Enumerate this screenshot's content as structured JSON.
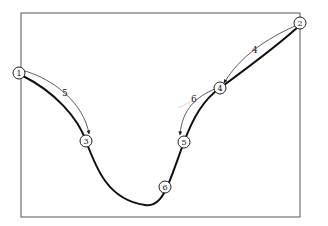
{
  "diagram": {
    "frame": {
      "x": 21,
      "y": 13,
      "w": 279,
      "h": 204,
      "stroke": "#555555"
    },
    "nodes": [
      {
        "id": "1",
        "label": "1",
        "x": 19,
        "y": 73
      },
      {
        "id": "2",
        "label": "2",
        "x": 300,
        "y": 23
      },
      {
        "id": "3",
        "label": "3",
        "x": 86,
        "y": 141
      },
      {
        "id": "4",
        "label": "4",
        "x": 220,
        "y": 88
      },
      {
        "id": "5",
        "label": "5",
        "x": 184,
        "y": 142
      },
      {
        "id": "6",
        "label": "6",
        "x": 165,
        "y": 187
      }
    ],
    "arrows": [
      {
        "from": "1",
        "to": "3",
        "label": "5",
        "label_x": 64,
        "label_y": 93
      },
      {
        "from": "2",
        "to": "4",
        "label": "4",
        "label_x": 254,
        "label_y": 51
      },
      {
        "from": "4",
        "to": "5",
        "label": "6",
        "label_x": 193,
        "label_y": 99
      }
    ],
    "main_curve_color": "#111111",
    "arrow_color": "#333333"
  }
}
